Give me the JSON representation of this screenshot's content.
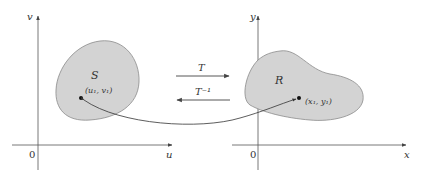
{
  "diagram": {
    "type": "change-of-variables transformation",
    "left_plane": {
      "vertical_axis_label": "v",
      "horizontal_axis_label": "u",
      "origin_label": "0",
      "region_label": "S",
      "point_label": "(u₁, v₁)"
    },
    "right_plane": {
      "vertical_axis_label": "y",
      "horizontal_axis_label": "x",
      "origin_label": "0",
      "region_label": "R",
      "point_label": "(x₁, y₁)"
    },
    "arrows": {
      "forward_label": "T",
      "inverse_label": "T⁻¹"
    },
    "colors": {
      "region_fill": "#d3d3d3",
      "region_stroke": "#8a8a8a",
      "axis": "#555555",
      "arrow": "#444444"
    }
  }
}
